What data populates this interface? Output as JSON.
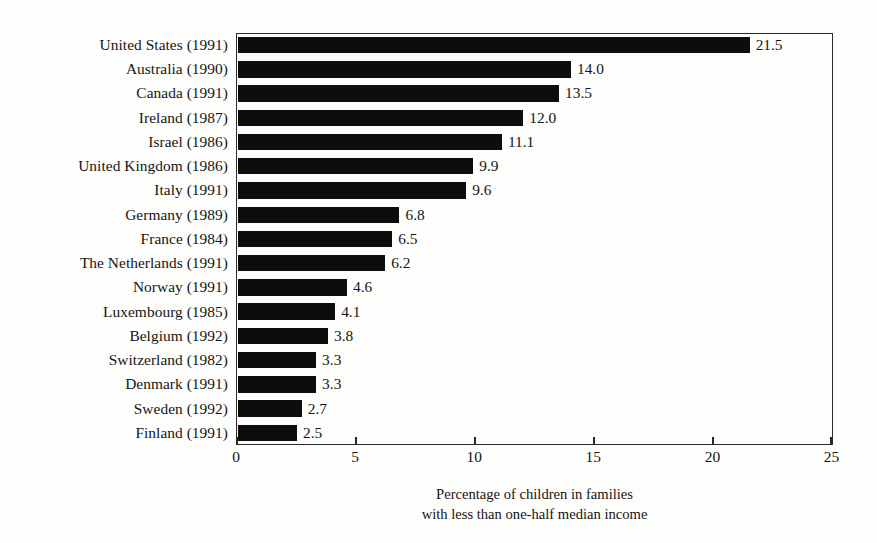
{
  "chart_data": {
    "type": "bar",
    "orientation": "horizontal",
    "title": "",
    "subtitle": "",
    "xlabel_lines": [
      "Percentage of children in families",
      "with less than one-half median income"
    ],
    "ylabel": "",
    "xlim": [
      0,
      25
    ],
    "xticks": [
      "0",
      "5",
      "10",
      "15",
      "20",
      "25"
    ],
    "xtick_values": [
      0,
      5,
      10,
      15,
      20,
      25
    ],
    "grid": false,
    "legend": "none",
    "bar_color": "#0d0d0d",
    "background_color": "#fdfdfc",
    "axis_color": "#2a2a2a",
    "categories": [
      "United States (1991)",
      "Australia (1990)",
      "Canada (1991)",
      "Ireland (1987)",
      "Israel (1986)",
      "United Kingdom (1986)",
      "Italy (1991)",
      "Germany (1989)",
      "France (1984)",
      "The Netherlands (1991)",
      "Norway (1991)",
      "Luxembourg (1985)",
      "Belgium (1992)",
      "Switzerland (1982)",
      "Denmark (1991)",
      "Sweden (1992)",
      "Finland (1991)"
    ],
    "values": [
      21.5,
      14.0,
      13.5,
      12.0,
      11.1,
      9.9,
      9.6,
      6.8,
      6.5,
      6.2,
      4.6,
      4.1,
      3.8,
      3.3,
      3.3,
      2.7,
      2.5
    ],
    "value_labels": [
      "21.5",
      "14.0",
      "13.5",
      "12.0",
      "11.1",
      "9.9",
      "9.6",
      "6.8",
      "6.5",
      "6.2",
      "4.6",
      "4.1",
      "3.8",
      "3.3",
      "3.3",
      "2.7",
      "2.5"
    ]
  }
}
